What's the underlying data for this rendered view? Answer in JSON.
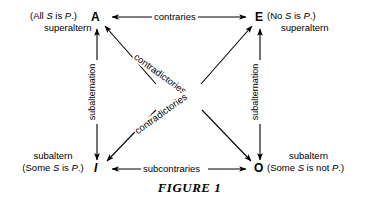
{
  "figure": {
    "caption": "FIGURE 1"
  },
  "corners": {
    "a": {
      "letter": "A",
      "proposition": "(All S is P.)",
      "role": "superaltern"
    },
    "e": {
      "letter": "E",
      "proposition": "(No S is P.)",
      "role": "superaltern"
    },
    "i": {
      "letter": "I",
      "proposition": "(Some S is P.)",
      "role": "subaltern"
    },
    "o": {
      "letter": "O",
      "proposition": "(Some S is not P.)",
      "role": "subaltern"
    }
  },
  "relations": {
    "top": "contraries",
    "bottom": "subcontraries",
    "left": "subalternation",
    "right": "subalternation",
    "diagonal_a_o": "contradictories",
    "diagonal_e_i": "contradictories"
  },
  "style": {
    "ink": "#000000",
    "paper": "#ffffff"
  }
}
